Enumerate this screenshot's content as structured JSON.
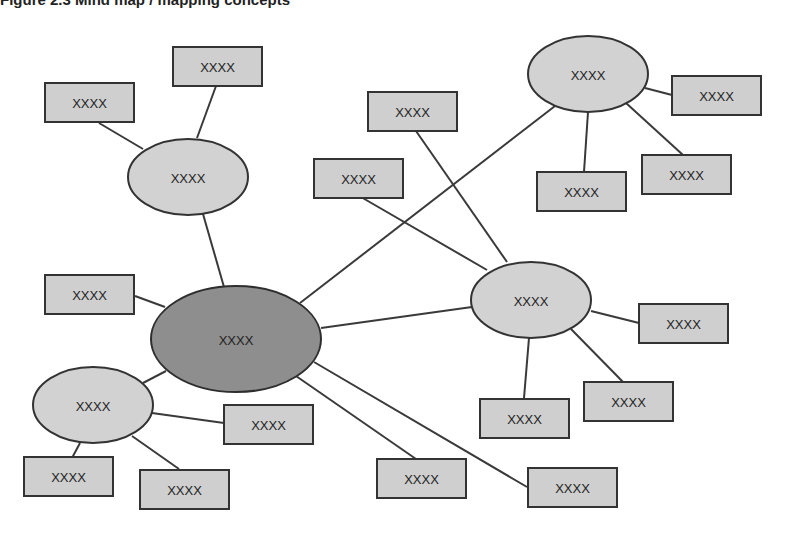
{
  "figure": {
    "title": "Figure 2.3  Mind map / mapping concepts"
  },
  "colors": {
    "box_fill": "#cfcfcf",
    "satellite_fill": "#d2d2d2",
    "hub_fill": "#8e8e8e",
    "stroke": "#333333"
  },
  "nodes": {
    "hub": {
      "label": "XXXX"
    },
    "sat_top_left": {
      "label": "XXXX"
    },
    "sat_top_right": {
      "label": "XXXX"
    },
    "sat_mid_right": {
      "label": "XXXX"
    },
    "sat_bottom_left": {
      "label": "XXXX"
    },
    "box_tl_a": {
      "label": "XXXX"
    },
    "box_tl_b": {
      "label": "XXXX"
    },
    "box_hub_left": {
      "label": "XXXX"
    },
    "box_mid_upper": {
      "label": "XXXX"
    },
    "box_mid_lower": {
      "label": "XXXX"
    },
    "box_tr_right": {
      "label": "XXXX"
    },
    "box_tr_lower_right": {
      "label": "XXXX"
    },
    "box_tr_bottom": {
      "label": "XXXX"
    },
    "box_mr_right": {
      "label": "XXXX"
    },
    "box_mr_lower_right": {
      "label": "XXXX"
    },
    "box_mr_bottom": {
      "label": "XXXX"
    },
    "box_hub_bottom_mid": {
      "label": "XXXX"
    },
    "box_hub_bottom_right": {
      "label": "XXXX"
    },
    "box_bl_right": {
      "label": "XXXX"
    },
    "box_bl_bottom_left": {
      "label": "XXXX"
    },
    "box_bl_bottom_right": {
      "label": "XXXX"
    }
  }
}
